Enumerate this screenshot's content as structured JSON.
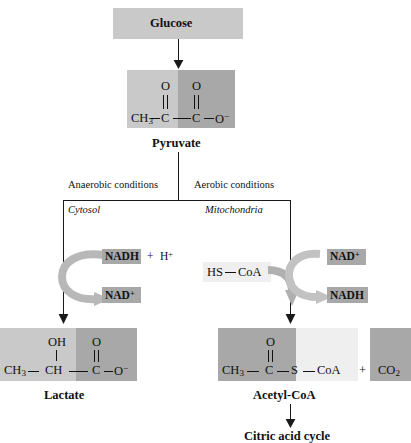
{
  "diagram": {
    "title_nodes": {
      "glucose": "Glucose",
      "pyruvate": "Pyruvate",
      "lactate": "Lactate",
      "acetyl_coa": "Acetyl-CoA",
      "citric_acid_cycle": "Citric acid cycle"
    },
    "branches": {
      "left_condition": "Anaerobic conditions",
      "right_condition": "Aerobic conditions",
      "left_compartment": "Cytosol",
      "right_compartment": "Mitochondria"
    },
    "cofactors": {
      "left_in": "NADH",
      "left_plus": "+",
      "left_proton": "H",
      "left_proton_charge": "+",
      "left_out": "NAD",
      "left_out_charge": "+",
      "right_in": "NAD",
      "right_in_charge": "+",
      "right_out": "NADH",
      "substrate": "HS",
      "substrate_tail": "CoA"
    },
    "byproduct": {
      "plus": "+",
      "label": "CO",
      "label_sub": "2"
    },
    "structures": {
      "pyruvate": {
        "c1": "CH",
        "c1_sub": "3",
        "c2": "C",
        "c3": "C",
        "o_top_left": "O",
        "o_top_right": "O",
        "o_term": "O",
        "o_term_charge": "−"
      },
      "lactate": {
        "c1": "CH",
        "c1_sub": "3",
        "c2": "CH",
        "c3": "C",
        "oh": "OH",
        "o_top": "O",
        "o_term": "O",
        "o_term_charge": "−"
      },
      "acetyl_coa": {
        "c1": "CH",
        "c1_sub": "3",
        "c2": "C",
        "o_top": "O",
        "s": "S",
        "coa": "CoA"
      }
    },
    "colors": {
      "box_light": "#c9c9c9",
      "box_dark": "#a8a8a8",
      "box_pale": "#efefef",
      "arrow_gray": "#b3b3b3",
      "line_black": "#1a1a1a"
    }
  }
}
